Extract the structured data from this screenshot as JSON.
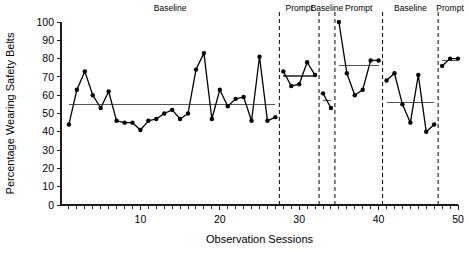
{
  "chart_data": {
    "type": "line",
    "title": "",
    "xlabel": "Observation Sessions",
    "ylabel": "Percentage Wearing Safety Belts",
    "xlim": [
      0,
      50
    ],
    "ylim": [
      0,
      100
    ],
    "xticks": [
      10,
      20,
      30,
      40,
      50
    ],
    "xtick_labels": [
      "10",
      "20",
      "30",
      "40",
      "50"
    ],
    "yticks": [
      0,
      10,
      20,
      30,
      40,
      50,
      60,
      70,
      80,
      90,
      100
    ],
    "ytick_labels": [
      "0",
      "10",
      "20",
      "30",
      "40",
      "50",
      "60",
      "70",
      "80",
      "90",
      "100"
    ],
    "grid": false,
    "legend": "none",
    "series": [
      {
        "name": "Percentage wearing safety belts",
        "x": [
          1,
          2,
          3,
          4,
          5,
          6,
          7,
          8,
          9,
          10,
          11,
          12,
          13,
          14,
          15,
          16,
          17,
          18,
          19,
          20,
          21,
          22,
          23,
          24,
          25,
          26,
          27,
          28,
          29,
          30,
          31,
          32,
          33,
          34,
          35,
          36,
          37,
          38,
          39,
          40,
          41,
          42,
          43,
          44,
          45,
          46,
          47,
          48,
          49,
          50
        ],
        "values": [
          44,
          63,
          73,
          60,
          53,
          62,
          46,
          45,
          45,
          41,
          46,
          47,
          50,
          52,
          47,
          50,
          74,
          83,
          47,
          63,
          54,
          58,
          59,
          46,
          81,
          46,
          48,
          73,
          65,
          66,
          78,
          71,
          61,
          53,
          100,
          72,
          60,
          63,
          79,
          79,
          68,
          72,
          55,
          45,
          71,
          40,
          44,
          76,
          80,
          80
        ]
      }
    ],
    "phases": [
      {
        "label": "Baseline",
        "x_start": 0,
        "x_end": 27.5,
        "mean": 55,
        "mean_x_start": 1,
        "mean_x_end": 27
      },
      {
        "label": "Prompt",
        "x_start": 27.5,
        "x_end": 32.5,
        "mean": 70.5,
        "mean_x_start": 28,
        "mean_x_end": 32
      },
      {
        "label": "Baseline",
        "x_start": 32.5,
        "x_end": 34.5,
        "mean": 57,
        "mean_x_start": 33,
        "mean_x_end": 34
      },
      {
        "label": "Prompt",
        "x_start": 34.5,
        "x_end": 40.5,
        "mean": 76,
        "mean_x_start": 35,
        "mean_x_end": 40
      },
      {
        "label": "Baseline",
        "x_start": 40.5,
        "x_end": 47.5,
        "mean": 56,
        "mean_x_start": 41,
        "mean_x_end": 47
      },
      {
        "label": "Prompt",
        "x_start": 47.5,
        "x_end": 50.5,
        "mean": 79,
        "mean_x_start": 48,
        "mean_x_end": 50
      }
    ],
    "phase_dividers": [
      27.5,
      32.5,
      34.5,
      40.5,
      47.5
    ],
    "colors": {
      "series": "#000000",
      "mean_line": "#555555",
      "axis": "#1a1a1a",
      "divider": "#000000",
      "background": "#ffffff"
    }
  }
}
